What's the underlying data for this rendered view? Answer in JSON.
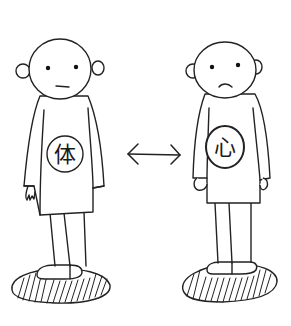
{
  "illustration": {
    "description": "Hand-drawn sketch of two bald figures standing on hatched ground patches, with a double-headed arrow between them",
    "left_figure": {
      "label": "体",
      "label_meaning": "body",
      "expression": "neutral"
    },
    "right_figure": {
      "label": "心",
      "label_meaning": "mind",
      "expression": "frown"
    },
    "arrow": {
      "glyph": "double-headed-arrow",
      "direction": "bidirectional"
    },
    "colors": {
      "background": "#ffffff",
      "ink": "#222222"
    }
  }
}
